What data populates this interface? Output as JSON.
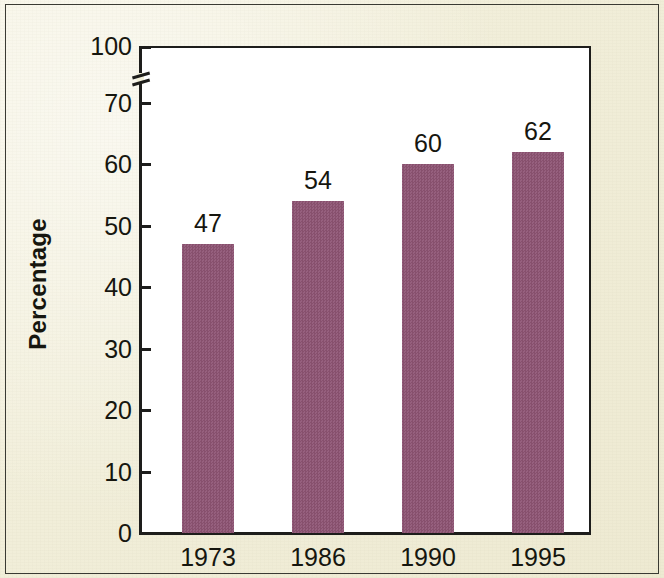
{
  "chart_data": {
    "type": "bar",
    "title": "",
    "subtitle": "",
    "xlabel": "",
    "ylabel": "Percentage",
    "categories": [
      "1973",
      "1986",
      "1990",
      "1995"
    ],
    "values": [
      47,
      54,
      60,
      62
    ],
    "value_labels": [
      "47",
      "54",
      "60",
      "62"
    ],
    "series": [
      {
        "name": "Percentage",
        "values": [
          47,
          54,
          60,
          62
        ],
        "color": "#8d5573"
      }
    ],
    "ylim": [
      0,
      100
    ],
    "y_ticks": [
      0,
      10,
      20,
      30,
      40,
      50,
      60,
      70,
      100
    ],
    "y_tick_labels": [
      "0",
      "10",
      "20",
      "30",
      "40",
      "50",
      "60",
      "70",
      "100"
    ],
    "y_axis_break": true,
    "y_axis_break_between": [
      70,
      100
    ],
    "grid": false,
    "legend": false,
    "legend_position": "none",
    "bar_color": "#8d5573",
    "plot_background": "#ffffff",
    "figure_background": "#f2efda",
    "axis_color": "#1d1d1b",
    "text_color": "#16160f"
  },
  "axes": {
    "y_title": "Percentage",
    "y_tick_labels": [
      "100",
      "70",
      "60",
      "50",
      "40",
      "30",
      "20",
      "10",
      "0"
    ],
    "x_tick_labels": [
      "1973",
      "1986",
      "1990",
      "1995"
    ]
  },
  "bars": [
    {
      "category": "1973",
      "value": 47,
      "label": "47"
    },
    {
      "category": "1986",
      "value": 54,
      "label": "54"
    },
    {
      "category": "1990",
      "value": 60,
      "label": "60"
    },
    {
      "category": "1995",
      "value": 62,
      "label": "62"
    }
  ]
}
